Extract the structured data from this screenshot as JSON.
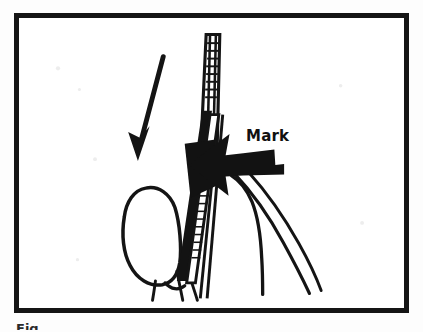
{
  "figure": {
    "type": "medical-illustration",
    "border_color": "#151515",
    "background_color": "#ffffff",
    "ink_color": "#111111"
  },
  "labels": {
    "mark": "Mark"
  },
  "caption": {
    "partial_text": "Fig"
  },
  "annotations": {
    "solid_arrow": {
      "name": "mark-arrow",
      "direction": "left",
      "description": "Thick filled black arrow pointing left at the mark on the catheter"
    },
    "thin_arrow": {
      "name": "advance-arrow",
      "direction": "down-left",
      "description": "Thin slanted arrow indicating direction of needle advancement"
    }
  },
  "instrument": {
    "syringe_barrel": "graduated barrel",
    "needle": "needle shaft",
    "catheter": "marked catheter shaft"
  },
  "anatomy": {
    "vessel": "vessel outline",
    "tissue": "surrounding tissue outlines"
  }
}
